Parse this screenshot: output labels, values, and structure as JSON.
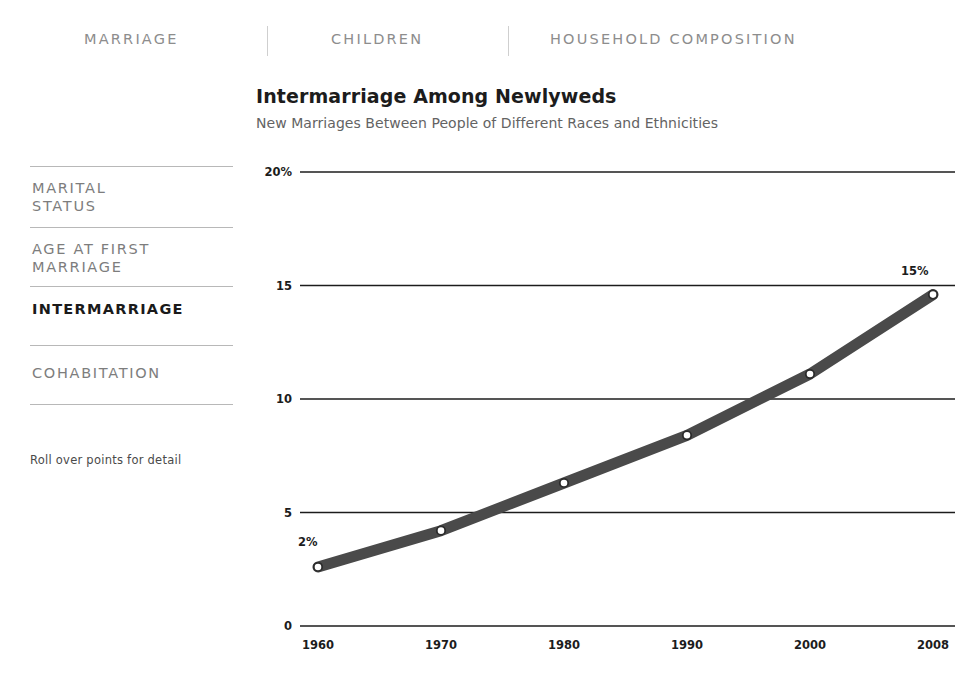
{
  "nav": {
    "items": [
      {
        "label": "MARRIAGE"
      },
      {
        "label": "CHILDREN"
      },
      {
        "label": "HOUSEHOLD COMPOSITION"
      }
    ]
  },
  "sidebar": {
    "items": [
      {
        "line1": "MARITAL",
        "line2": "STATUS",
        "active": false
      },
      {
        "line1": "AGE AT FIRST",
        "line2": "MARRIAGE",
        "active": false
      },
      {
        "line1": "INTERMARRIAGE",
        "line2": "",
        "active": true
      },
      {
        "line1": "COHABITATION",
        "line2": "",
        "active": false
      }
    ],
    "note": "Roll over points for detail"
  },
  "chart_data": {
    "type": "line",
    "title": "Intermarriage Among Newlyweds",
    "subtitle": "New Marriages Between People of Different Races and Ethnicities",
    "xlabel": "",
    "ylabel": "",
    "x": [
      1960,
      1970,
      1980,
      1990,
      2000,
      2008
    ],
    "categories": [
      "1960",
      "1970",
      "1980",
      "1990",
      "2000",
      "2008"
    ],
    "values": [
      2.6,
      4.2,
      6.3,
      8.4,
      11.1,
      14.6
    ],
    "series": [
      {
        "name": "Intermarriage rate",
        "values": [
          2.6,
          4.2,
          6.3,
          8.4,
          11.1,
          14.6
        ]
      }
    ],
    "ylim": [
      0,
      20
    ],
    "yticks": [
      0,
      5,
      10,
      15,
      20
    ],
    "ytick_labels": [
      "0",
      "5",
      "10",
      "15",
      "20%"
    ],
    "xtick_labels": [
      "1960",
      "1970",
      "1980",
      "1990",
      "2000",
      "2008"
    ],
    "grid": true,
    "legend": "none",
    "annotations": [
      {
        "text": "2%",
        "at_x": 1960,
        "at_y": 2.6
      },
      {
        "text": "15%",
        "at_x": 2008,
        "at_y": 14.6
      }
    ],
    "colors": {
      "line": "#4a4a4a",
      "marker_fill": "#ffffff",
      "marker_stroke": "#2b2b2b",
      "grid": "#1c1c1c",
      "text": "#1c1c1c"
    }
  }
}
